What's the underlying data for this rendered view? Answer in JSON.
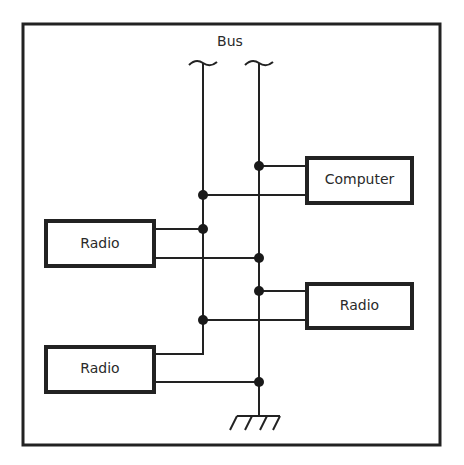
{
  "diagram": {
    "bus_label": "Bus",
    "boxes": [
      {
        "id": "computer",
        "label": "Computer"
      },
      {
        "id": "radio-left-top",
        "label": "Radio"
      },
      {
        "id": "radio-right",
        "label": "Radio"
      },
      {
        "id": "radio-left-bottom",
        "label": "Radio"
      }
    ],
    "ground_symbol": "ground-icon",
    "colors": {
      "line": "#1a1a1a",
      "background": "#ffffff"
    }
  }
}
